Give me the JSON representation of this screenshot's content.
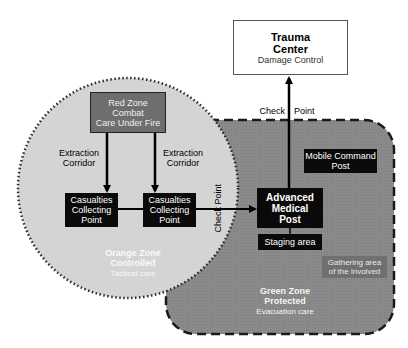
{
  "colors": {
    "orange_zone_fill": "#d4d4d4",
    "green_zone_fill": "#8a8a8a",
    "red_zone_fill": "#6e6e6e",
    "gathering_fill": "#707070",
    "black_box": "#0a0a0a",
    "white": "#ffffff"
  },
  "trauma_center": {
    "title_line1": "Trauma",
    "title_line2": "Center",
    "subtitle": "Damage Control"
  },
  "check_point_top": {
    "left": "Check",
    "right": "Point"
  },
  "check_point_side": {
    "text": "Check Point"
  },
  "red_zone": {
    "line1": "Red Zone",
    "line2": "Combat",
    "line3": "Care Under Fire"
  },
  "corridors": [
    {
      "line1": "Extraction",
      "line2": "Corridor"
    },
    {
      "line1": "Extraction",
      "line2": "Corridor"
    }
  ],
  "collecting_points": [
    {
      "line1": "Casualties",
      "line2": "Collecting",
      "line3": "Point"
    },
    {
      "line1": "Casualties",
      "line2": "Collecting",
      "line3": "Point"
    }
  ],
  "orange_zone": {
    "line1": "Orange Zone",
    "line2": "Controlled",
    "line3": "Tactical care"
  },
  "advanced_medical_post": {
    "line1": "Advanced",
    "line2": "Medical",
    "line3": "Post"
  },
  "staging_area": {
    "text": "Staging area"
  },
  "mobile_command_post": {
    "line1": "Mobile Command",
    "line2": "Post"
  },
  "gathering_area": {
    "line1": "Gathering area",
    "line2": "of the involved"
  },
  "green_zone": {
    "line1": "Green Zone",
    "line2": "Protected",
    "line3": "Evacuation care"
  }
}
